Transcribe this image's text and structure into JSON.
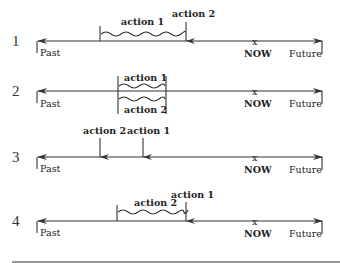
{
  "timeline_labels": {
    "past": "Past",
    "now": "NOW",
    "future": "Future",
    "now_marker": "x"
  },
  "rows": [
    {
      "number": "1",
      "labels": {
        "action1": "action 1",
        "action2": "action 2"
      },
      "description": "action 1 is an ongoing (wavy) action in the past that is interrupted by action 2, a point-in-time event"
    },
    {
      "number": "2",
      "labels": {
        "action1": "action 1",
        "action2": "action 2"
      },
      "description": "action 1 and action 2 are two ongoing actions occurring simultaneously in the past"
    },
    {
      "number": "3",
      "labels": {
        "action2": "action 2",
        "action1": "action 1"
      },
      "description": "action 2 and action 1 are two point events in the past; action 2 happens first"
    },
    {
      "number": "4",
      "labels": {
        "action2": "action 2",
        "action1": "action 1"
      },
      "description": "action 2 is an ongoing action that continues up to point event action 1"
    }
  ],
  "colors": {
    "line": "#333333",
    "text": "#222222",
    "background": "#ffffff"
  }
}
